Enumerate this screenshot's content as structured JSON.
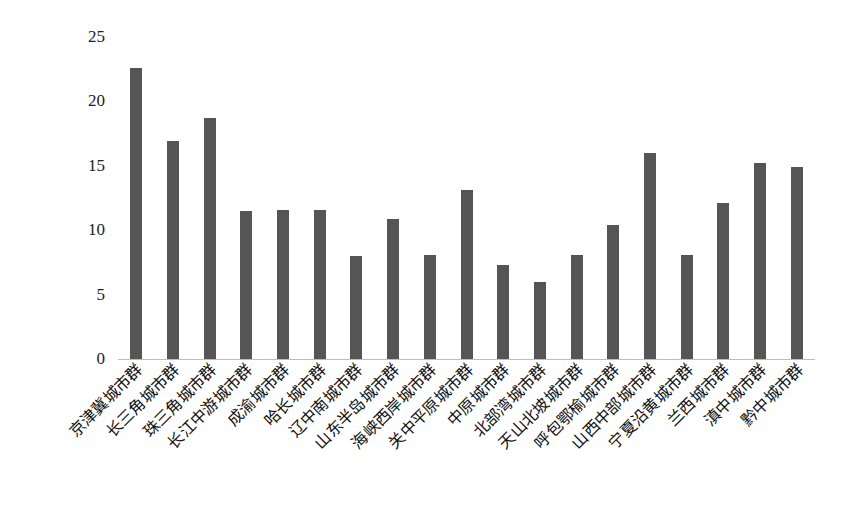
{
  "chart_data": {
    "type": "bar",
    "title": "",
    "xlabel": "",
    "ylabel": "",
    "ylim": [
      0,
      25
    ],
    "yticks": [
      0,
      5,
      10,
      15,
      20,
      25
    ],
    "grid": false,
    "legend": null,
    "bar_color": "#555555",
    "axis_color": "#bdbdbd",
    "categories": [
      "京津冀城市群",
      "长三角城市群",
      "珠三角城市群",
      "长江中游城市群",
      "成渝城市群",
      "哈长城市群",
      "辽中南城市群",
      "山东半岛城市群",
      "海峡西岸城市群",
      "关中平原城市群",
      "中原城市群",
      "北部湾城市群",
      "天山北坡城市群",
      "呼包鄂榆城市群",
      "山西中部城市群",
      "宁夏沿黄城市群",
      "兰西城市群",
      "滇中城市群",
      "黔中城市群"
    ],
    "values": [
      22.6,
      16.9,
      18.7,
      11.5,
      11.6,
      11.6,
      8.0,
      10.9,
      8.1,
      13.1,
      7.3,
      6.0,
      8.1,
      10.4,
      16.0,
      8.1,
      12.1,
      15.2,
      14.9
    ]
  }
}
